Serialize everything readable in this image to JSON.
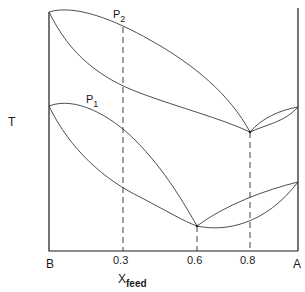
{
  "diagram": {
    "type": "binary phase diagram (T vs composition) at two pressures",
    "y_axis_label": "T",
    "x_axis_label": "X",
    "x_axis_label_sub": "feed",
    "x_left_label": "B",
    "x_right_label": "A",
    "x_ticks": [
      "0.3",
      "0.6",
      "0.8"
    ],
    "curves": [
      {
        "label": "P",
        "label_sub": "2",
        "azeotrope_x": "0.8"
      },
      {
        "label": "P",
        "label_sub": "1",
        "azeotrope_x": "0.6"
      }
    ],
    "dashed_lines_at": [
      "0.3",
      "0.6",
      "0.8"
    ]
  }
}
